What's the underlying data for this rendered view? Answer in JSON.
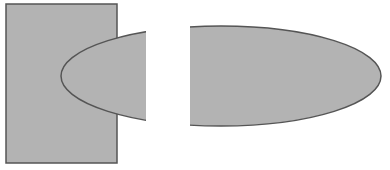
{
  "diagram": {
    "colors": {
      "background": "#ffffff",
      "fill": "#b3b3b3",
      "stroke": "#555555",
      "gap": "#ffffff"
    },
    "shapes": {
      "rectangle": {
        "x": 6,
        "y": 4,
        "width": 111,
        "height": 159
      },
      "ellipse": {
        "cx": 221,
        "cy": 76,
        "rx": 160,
        "ry": 50
      },
      "gap": {
        "x": 146,
        "y": 0,
        "width": 44,
        "height": 170
      }
    }
  }
}
